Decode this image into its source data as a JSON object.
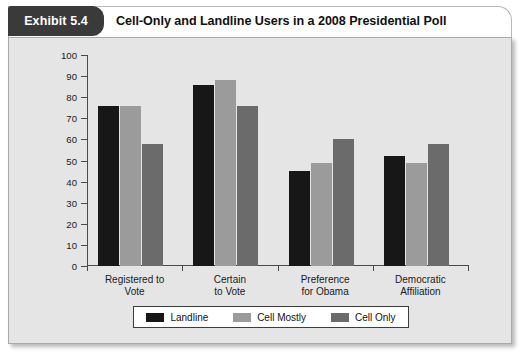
{
  "exhibit": {
    "badge_label": "Exhibit 5.4",
    "title": "Cell-Only and Landline Users in a 2008 Presidential Poll"
  },
  "colors": {
    "landline": "#171717",
    "cell_mostly": "#9b9b9b",
    "cell_only": "#6b6b6b",
    "panel_background": "#e5e5e5",
    "badge_background": "#3a3a3a",
    "axis": "#4a4a4a"
  },
  "chart_data": {
    "type": "bar",
    "title": "Cell-Only and Landline Users in a 2008 Presidential Poll",
    "xlabel": "",
    "ylabel": "",
    "ylim": [
      0,
      100
    ],
    "ytick_labels": [
      "100",
      "90",
      "80",
      "70",
      "60",
      "50",
      "40",
      "30",
      "20",
      "10",
      "0"
    ],
    "yticks": [
      100,
      90,
      80,
      70,
      60,
      50,
      40,
      30,
      20,
      10,
      0
    ],
    "grid": false,
    "legend_position": "bottom",
    "categories": [
      "Registered to Vote",
      "Certain to Vote",
      "Preference for Obama",
      "Democratic Affiliation"
    ],
    "category_lines": [
      [
        "Registered to",
        "Vote"
      ],
      [
        "Certain",
        "to Vote"
      ],
      [
        "Preference",
        "for Obama"
      ],
      [
        "Democratic",
        "Affiliation"
      ]
    ],
    "series": [
      {
        "name": "Landline",
        "color": "#171717",
        "values": [
          76,
          86,
          45,
          52
        ]
      },
      {
        "name": "Cell Mostly",
        "color": "#9b9b9b",
        "values": [
          76,
          88,
          49,
          49
        ]
      },
      {
        "name": "Cell Only",
        "color": "#6b6b6b",
        "values": [
          58,
          76,
          60,
          58
        ]
      }
    ]
  }
}
